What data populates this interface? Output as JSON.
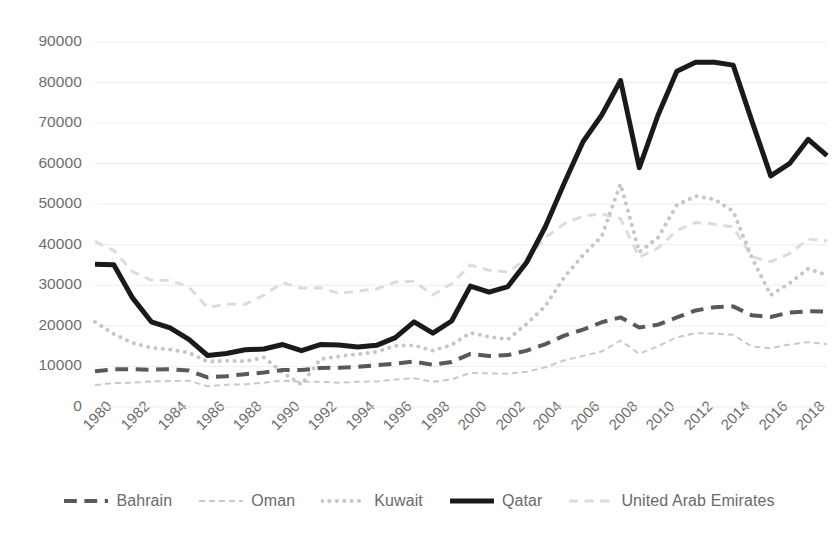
{
  "chart_data": {
    "type": "line",
    "title": "",
    "subtitle": "",
    "xlabel": "",
    "ylabel": "",
    "xlim": [
      1980,
      2019
    ],
    "ylim": [
      0,
      90000
    ],
    "grid": true,
    "legend_position": "bottom",
    "y_ticks": [
      "0",
      "10000",
      "20000",
      "30000",
      "40000",
      "50000",
      "60000",
      "70000",
      "80000",
      "90000"
    ],
    "y_tick_values": [
      0,
      10000,
      20000,
      30000,
      40000,
      50000,
      60000,
      70000,
      80000,
      90000
    ],
    "x_ticks": [
      "1980",
      "1982",
      "1984",
      "1986",
      "1988",
      "1990",
      "1992",
      "1994",
      "1996",
      "1998",
      "2000",
      "2002",
      "2004",
      "2006",
      "2008",
      "2010",
      "2012",
      "2014",
      "2016",
      "2018"
    ],
    "x": [
      1980,
      1981,
      1982,
      1983,
      1984,
      1985,
      1986,
      1987,
      1988,
      1989,
      1990,
      1991,
      1992,
      1993,
      1994,
      1995,
      1996,
      1997,
      1998,
      1999,
      2000,
      2001,
      2002,
      2003,
      2004,
      2005,
      2006,
      2007,
      2008,
      2009,
      2010,
      2011,
      2012,
      2013,
      2014,
      2015,
      2016,
      2017,
      2018,
      2019
    ],
    "series": [
      {
        "name": "Bahrain",
        "style": "dashed",
        "color": "#595959",
        "width": 4,
        "values": [
          8800,
          9300,
          9300,
          9200,
          9300,
          9000,
          7300,
          7600,
          8100,
          8500,
          9100,
          9100,
          9600,
          9700,
          9900,
          10300,
          10700,
          11200,
          10400,
          11100,
          13100,
          12600,
          12800,
          13900,
          15500,
          17600,
          19100,
          20900,
          22100,
          19600,
          20300,
          22100,
          23800,
          24600,
          24800,
          22600,
          22200,
          23300,
          23600,
          23500
        ]
      },
      {
        "name": "Oman",
        "style": "thin-light",
        "color": "#c9c9c9",
        "width": 2,
        "values": [
          5400,
          5900,
          6000,
          6300,
          6400,
          6500,
          5100,
          5500,
          5600,
          6000,
          6500,
          6200,
          6200,
          6000,
          6200,
          6300,
          6800,
          7100,
          6200,
          6800,
          8400,
          8300,
          8200,
          8700,
          9800,
          11500,
          12600,
          13700,
          16400,
          13100,
          15000,
          17200,
          18200,
          18100,
          17800,
          14900,
          14500,
          15400,
          16000,
          15500
        ]
      },
      {
        "name": "Kuwait",
        "style": "dotted",
        "color": "#c6c6c6",
        "width": 4,
        "values": [
          21000,
          18000,
          15800,
          14600,
          14200,
          13400,
          11200,
          11400,
          11300,
          12200,
          8500,
          5500,
          11800,
          12500,
          13000,
          13600,
          15100,
          15200,
          13900,
          15300,
          18300,
          17300,
          16700,
          20500,
          24900,
          32000,
          37400,
          42100,
          55000,
          38200,
          41800,
          49800,
          52000,
          51200,
          48300,
          36800,
          27600,
          30500,
          34100,
          32500
        ]
      },
      {
        "name": "Qatar",
        "style": "solid",
        "color": "#1a1a1a",
        "width": 5,
        "values": [
          35200,
          35100,
          26900,
          21000,
          19500,
          16700,
          12700,
          13200,
          14100,
          14300,
          15400,
          13900,
          15400,
          15300,
          14800,
          15200,
          17100,
          21000,
          18200,
          21200,
          29800,
          28300,
          29700,
          35700,
          44500,
          55200,
          65400,
          72000,
          80500,
          59000,
          72000,
          82800,
          85000,
          85000,
          84300,
          70500,
          57000,
          60000,
          66000,
          62000
        ]
      },
      {
        "name": "United Arab Emirates",
        "style": "dashed-faint",
        "color": "#dcdcdc",
        "width": 3,
        "values": [
          40800,
          38600,
          33400,
          31300,
          31200,
          29600,
          24500,
          25400,
          25300,
          27600,
          30700,
          29300,
          29400,
          28000,
          28600,
          29100,
          30800,
          31000,
          27600,
          30400,
          35000,
          33700,
          33300,
          36500,
          41800,
          45200,
          47100,
          47600,
          46400,
          36900,
          39200,
          43500,
          45500,
          45100,
          44400,
          37000,
          35800,
          37800,
          41400,
          41000
        ]
      }
    ]
  },
  "legend": {
    "items": [
      {
        "label": "Bahrain",
        "swatch": "dashed-dark-swatch"
      },
      {
        "label": "Oman",
        "swatch": "thin-light-swatch"
      },
      {
        "label": "Kuwait",
        "swatch": "dotted-swatch"
      },
      {
        "label": "Qatar",
        "swatch": "solid-dark-swatch"
      },
      {
        "label": "United Arab Emirates",
        "swatch": "dashed-faint-swatch"
      }
    ]
  }
}
